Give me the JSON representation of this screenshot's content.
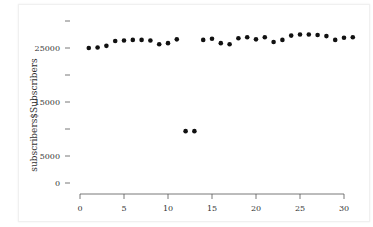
{
  "chart_data": {
    "type": "scatter",
    "title": "",
    "xlabel": "",
    "ylabel": "subscribers$Subscribers",
    "x": [
      1,
      2,
      3,
      4,
      5,
      6,
      7,
      8,
      9,
      10,
      11,
      12,
      13,
      14,
      15,
      16,
      17,
      18,
      19,
      20,
      21,
      22,
      23,
      24,
      25,
      26,
      27,
      28,
      29,
      30,
      31
    ],
    "y": [
      25000,
      25100,
      25400,
      26300,
      26400,
      26500,
      26500,
      26400,
      25700,
      25900,
      26600,
      9600,
      9600,
      26500,
      26700,
      25900,
      25700,
      26800,
      27000,
      26600,
      27000,
      26100,
      26500,
      27300,
      27500,
      27500,
      27400,
      27200,
      26500,
      26900,
      27000
    ],
    "xticks": [
      0,
      5,
      10,
      15,
      20,
      25,
      30
    ],
    "yticks": [
      0,
      5000,
      10000,
      15000,
      20000,
      25000,
      30000
    ],
    "ytick_labels": [
      "0",
      "5000",
      "",
      "15000",
      "",
      "25000",
      ""
    ],
    "xlim": [
      0,
      31
    ],
    "ylim": [
      0,
      30000
    ],
    "grid": false,
    "legend": null
  }
}
